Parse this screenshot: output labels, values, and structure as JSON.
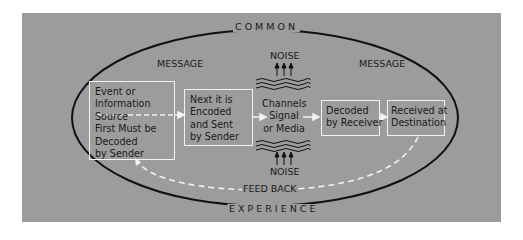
{
  "diagram": {
    "title_top": "COMMON",
    "title_bottom": "EXPERIENCE",
    "message_left": "MESSAGE",
    "message_right": "MESSAGE",
    "noise_top": "NOISE",
    "noise_bottom": "NOISE",
    "feedback": "FEED BACK",
    "boxes": [
      {
        "lines": [
          "Event or",
          "Information",
          "Source",
          "First Must be",
          "Decoded",
          "by Sender"
        ]
      },
      {
        "lines": [
          "Next it is",
          "Encoded",
          "and Sent",
          "by Sender"
        ]
      },
      {
        "lines": [
          "Decoded",
          "by Receiver"
        ]
      },
      {
        "lines": [
          "Received at",
          "Destination"
        ]
      }
    ],
    "channel": {
      "lines": [
        "Channels",
        "Signal",
        "or Media"
      ]
    }
  },
  "colors": {
    "panel": "#9c9c9c",
    "ellipse": "#111111",
    "box_border": "#f2f2f2",
    "feedback_dash": "#f2f2f2",
    "text": "#1a1a1a"
  }
}
